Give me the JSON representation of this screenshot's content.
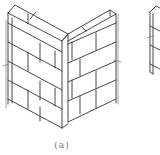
{
  "figure": {
    "caption": "(a)",
    "line_color": "#333333",
    "background": "#ffffff"
  },
  "partial_figure": {
    "subject": "second-brick-wall-figure-cropped"
  }
}
